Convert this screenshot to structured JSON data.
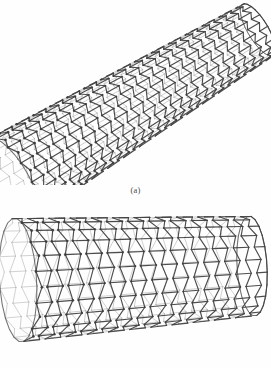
{
  "figure": {
    "background_color": "#ffffff",
    "bond_color": "#444444",
    "atom_color": "#3a3a3a",
    "shade_color": "#8a8a8a",
    "panels": [
      {
        "id": "a",
        "caption": "(a)",
        "subject": "single-walled carbon nanotube",
        "orientation": "tilted",
        "tilt_degrees": -31,
        "lattice": "hexagonal honeycomb",
        "near_end": "open",
        "far_end": "capped"
      },
      {
        "id": "b",
        "caption": "(b)",
        "subject": "single-walled carbon nanotube",
        "orientation": "horizontal",
        "tilt_degrees": -4,
        "lattice": "hexagonal honeycomb",
        "near_end": "open",
        "far_end": "capped"
      }
    ]
  },
  "chart_data": {
    "type": "diagram",
    "title": "",
    "subtitle": "",
    "xlabel": "",
    "ylabel": "",
    "panels": [
      {
        "label": "(a)",
        "structure": "carbon nanotube",
        "chirality": "armchair",
        "axis_start": [
          12,
          178
        ],
        "axis_end": [
          258,
          30
        ],
        "radius_near": 46,
        "radius_far": 30,
        "rings_around": 26,
        "rings_along": 30
      },
      {
        "label": "(b)",
        "structure": "carbon nanotube",
        "chirality": "armchair",
        "axis_start": [
          18,
          80
        ],
        "axis_end": [
          252,
          66
        ],
        "radius_near": 62,
        "radius_far": 50,
        "rings_around": 24,
        "rings_along": 22
      }
    ]
  }
}
